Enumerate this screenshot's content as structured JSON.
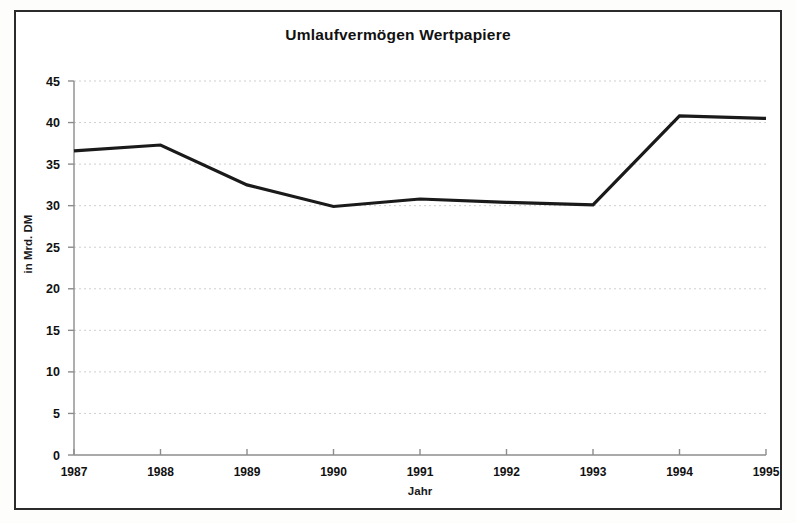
{
  "chart_data": {
    "type": "line",
    "title": "Umlaufvermögen Wertpapiere",
    "xlabel": "Jahr",
    "ylabel": "in Mrd. DM",
    "categories": [
      "1987",
      "1988",
      "1989",
      "1990",
      "1991",
      "1992",
      "1993",
      "1994",
      "1995"
    ],
    "x": [
      1987,
      1988,
      1989,
      1990,
      1991,
      1992,
      1993,
      1994,
      1995
    ],
    "values": [
      36.6,
      37.3,
      32.5,
      29.9,
      30.8,
      30.4,
      30.1,
      40.8,
      40.5
    ],
    "series": [
      {
        "name": "Umlaufvermögen Wertpapiere",
        "values": [
          36.6,
          37.3,
          32.5,
          29.9,
          30.8,
          30.4,
          30.1,
          40.8,
          40.5
        ]
      }
    ],
    "ylim": [
      0,
      45
    ],
    "yticks": [
      0,
      5,
      10,
      15,
      20,
      25,
      30,
      35,
      40,
      45
    ],
    "ytick_labels": [
      "0",
      "5",
      "10",
      "15",
      "20",
      "25",
      "30",
      "35",
      "40",
      "45"
    ],
    "xtick_labels": [
      "1987",
      "1988",
      "1989",
      "1990",
      "1991",
      "1992",
      "1993",
      "1994",
      "1995"
    ],
    "grid": true,
    "grid_style": "dotted-horizontal",
    "legend": false,
    "line_color": "#1a1a1a",
    "grid_color": "#cfcfcf",
    "axis_color": "#8c8c8c",
    "frame_color": "#2b2b2b",
    "background_color": "#ffffff"
  },
  "axes": {
    "y": {
      "label": "in Mrd. DM",
      "ticks": [
        "45",
        "40",
        "35",
        "30",
        "25",
        "20",
        "15",
        "10",
        "5",
        "0"
      ]
    },
    "x": {
      "label": "Jahr",
      "ticks": [
        "1987",
        "1988",
        "1989",
        "1990",
        "1991",
        "1992",
        "1993",
        "1994",
        "1995"
      ]
    }
  },
  "figure": {
    "title": "Umlaufvermögen Wertpapiere"
  }
}
